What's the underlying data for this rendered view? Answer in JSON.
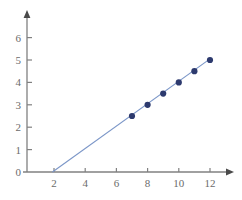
{
  "chart_data": {
    "type": "scatter",
    "title": "",
    "subtitle": "",
    "xlabel": "",
    "ylabel": "",
    "xlim": [
      0,
      13.5
    ],
    "ylim": [
      0,
      6.6
    ],
    "grid": false,
    "legend": null,
    "x_ticks": [
      2,
      4,
      6,
      8,
      10,
      12
    ],
    "y_ticks": [
      0,
      1,
      2,
      3,
      4,
      5,
      6
    ],
    "x_tick_labels": [
      "2",
      "4",
      "6",
      "8",
      "10",
      "12"
    ],
    "y_tick_labels": [
      "0",
      "1",
      "2",
      "3",
      "4",
      "5",
      "6"
    ],
    "series": [
      {
        "name": "data points",
        "marker": "circle",
        "marker_color": "#2d3a6e",
        "x": [
          7,
          8,
          9,
          10,
          11,
          12
        ],
        "y": [
          2.5,
          3.0,
          3.5,
          4.0,
          4.5,
          5.0
        ]
      },
      {
        "name": "fit line",
        "type": "line",
        "line_color": "#7b96c8",
        "slope": 0.5,
        "x_intercept": 1.9,
        "x": [
          1.9,
          12
        ],
        "y": [
          0,
          5.05
        ]
      }
    ],
    "colors": {
      "marker": "#2d3a6e",
      "line": "#7b96c8",
      "axis": "#808080",
      "tick_text": "#6b6b6b",
      "background": "#ffffff"
    },
    "axis_geometry": {
      "x_axis_pixel_y": 172,
      "y_axis_pixel_x": 27,
      "x_unit_pixels": 15.6,
      "y_unit_pixels": 22.4,
      "x_origin_pixel": 23,
      "arrow_x_tip": 232,
      "arrow_y_tip": 12
    }
  }
}
